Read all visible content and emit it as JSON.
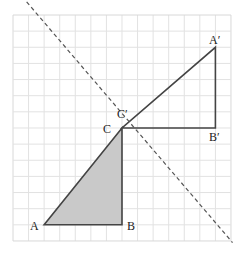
{
  "diagram": {
    "type": "geometric-transformation",
    "grid": {
      "cols": 14,
      "rows": 14,
      "origin_px": [
        13,
        15
      ],
      "cell_w": 15.57,
      "cell_h": 16.14,
      "line_color": "#e2e2e2",
      "border_color": "#d8d8d8"
    },
    "mirror_line": {
      "from": [
        0,
        -1.8
      ],
      "to": [
        14.1,
        14.1
      ],
      "style": "dashed",
      "color": "#555555"
    },
    "triangles": [
      {
        "name": "ABC",
        "vertices": {
          "A": [
            2,
            13
          ],
          "B": [
            7,
            13
          ],
          "C": [
            7,
            7
          ]
        },
        "fill": "#c9c9c9",
        "stroke": "#444444"
      },
      {
        "name": "A'B'C'",
        "vertices": {
          "A'": [
            13,
            2
          ],
          "B'": [
            13,
            7
          ],
          "C'": [
            7,
            7
          ]
        },
        "fill": "none",
        "stroke": "#444444"
      }
    ],
    "labels": [
      {
        "id": "A",
        "text": "A",
        "x": 30,
        "y": 230
      },
      {
        "id": "B",
        "text": "B",
        "x": 127,
        "y": 230
      },
      {
        "id": "C",
        "text": "C",
        "x": 103,
        "y": 133
      },
      {
        "id": "C_prime",
        "text": "C′",
        "x": 117,
        "y": 118
      },
      {
        "id": "A_prime",
        "text": "A′",
        "x": 209,
        "y": 44
      },
      {
        "id": "B_prime",
        "text": "B′",
        "x": 209,
        "y": 141
      }
    ]
  }
}
